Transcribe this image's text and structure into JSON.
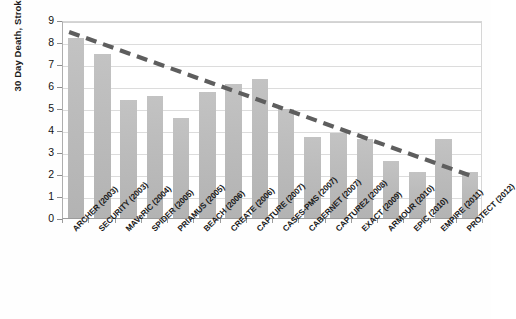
{
  "chart_data": {
    "type": "bar",
    "title": "",
    "xlabel": "",
    "ylabel": "30 Day Death, Stroke and MI (%)",
    "ylim": [
      0,
      9
    ],
    "yticks": [
      "0",
      "1",
      "2",
      "3",
      "4",
      "5",
      "6",
      "7",
      "8",
      "9"
    ],
    "grid": true,
    "legend": "none",
    "categories": [
      "ARCHER (2003)",
      "SECURITY (2003)",
      "MAVeRIC (2004)",
      "SPIDER (2005)",
      "PRIAMUS (2005)",
      "BEACH (2006)",
      "CREATE (2006)",
      "CAPTURE (2007)",
      "CASES-PMS (2007)",
      "CABERNET (2007)",
      "CAPTURE2 (2008)",
      "EXACT (2009)",
      "ARMOUR (2010)",
      "EPIC (2010)",
      "EMPIRE (2011)",
      "PROTECT (2012)"
    ],
    "values": [
      8.2,
      7.45,
      5.35,
      5.55,
      4.55,
      5.75,
      6.1,
      6.3,
      4.95,
      3.7,
      3.85,
      3.6,
      2.6,
      2.1,
      3.6,
      2.1
    ],
    "series": [
      {
        "name": "30 Day Death, Stroke and MI (%)",
        "values": [
          8.2,
          7.45,
          5.35,
          5.55,
          4.55,
          5.75,
          6.1,
          6.3,
          4.95,
          3.7,
          3.85,
          3.6,
          2.6,
          2.1,
          3.6,
          2.1
        ]
      }
    ],
    "trendline": {
      "style": "dashed",
      "color": "#5e5e5e",
      "start_value": 8.5,
      "end_value": 1.9
    },
    "colors": {
      "bar": "#bcbcbc",
      "trendline": "#5e5e5e",
      "gridline": "#dcdcdc",
      "axis": "#9c9c9c",
      "text": "#1a1a1a"
    }
  }
}
